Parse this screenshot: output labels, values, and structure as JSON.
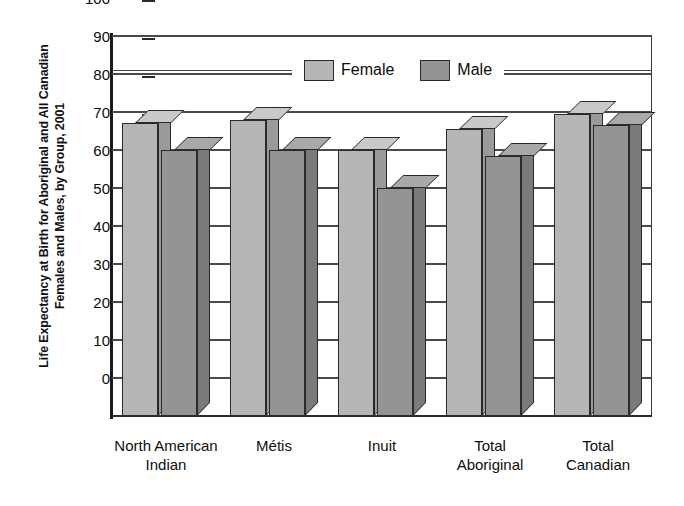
{
  "chart_data": {
    "type": "bar",
    "title": "",
    "ylabel_lines": [
      "Life Expectancy at Birth for Aboriginal and All Canadian",
      "Females and Males, by Group, 2001"
    ],
    "ylabel": "Life Expectancy at Birth for Aboriginal and All Canadian Females and Males, by Group, 2001",
    "xlabel": "",
    "ylim": [
      0,
      100
    ],
    "ytick_labels": [
      "100",
      "90",
      "80",
      "70",
      "60",
      "50",
      "40",
      "30",
      "20",
      "10",
      "0"
    ],
    "ytick_values": [
      100,
      90,
      80,
      70,
      60,
      50,
      40,
      30,
      20,
      10,
      0
    ],
    "grid": true,
    "legend_position": "top-center",
    "categories": [
      "North American Indian",
      "Métis",
      "Inuit",
      "Total Aboriginal",
      "Total Canadian"
    ],
    "category_lines": [
      [
        "North American",
        "Indian"
      ],
      [
        "Métis"
      ],
      [
        "Inuit"
      ],
      [
        "Total",
        "Aboriginal"
      ],
      [
        "Total",
        "Canadian"
      ]
    ],
    "series": [
      {
        "name": "Female",
        "color": "#b6b6b6",
        "values": [
          77,
          78,
          70,
          75.5,
          79.5
        ]
      },
      {
        "name": "Male",
        "color": "#949494",
        "values": [
          70,
          70,
          60,
          68.5,
          76.5
        ]
      }
    ]
  },
  "legend": {
    "female_label": "Female",
    "male_label": "Male"
  },
  "colors": {
    "female": "#b6b6b6",
    "male": "#949494",
    "axis": "#2a2a2a",
    "grid": "#4a4a4a",
    "background": "#ffffff"
  }
}
